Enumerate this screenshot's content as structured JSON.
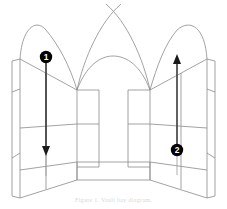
{
  "figure": {
    "background_color": "#ffffff",
    "width": 227,
    "height": 209,
    "line_color": "#8a8a8a",
    "heavy_line_color": "#555555",
    "marker_fill": "#000000",
    "marker_text_color": "#ffffff"
  },
  "caption": {
    "text": "Figure 1. Vault bay diagram."
  },
  "markers": [
    {
      "id": "marker-1",
      "label": "1",
      "center_x": 46,
      "center_y": 57,
      "radius": 6,
      "arrow_direction": "down",
      "arrow_from_y": 63,
      "arrow_to_y": 152,
      "arrow_x": 46,
      "tail_to_y": 176
    },
    {
      "id": "marker-2",
      "label": "2",
      "center_x": 177,
      "center_y": 150,
      "radius": 6,
      "arrow_direction": "up",
      "arrow_from_y": 144,
      "arrow_to_y": 58,
      "arrow_x": 177,
      "tail_to_y": 175
    }
  ],
  "geometry": {
    "left_strip": {
      "name": "left-outer-pier-strip",
      "top_outer_y": 59,
      "bottom_outer_y": 196
    },
    "right_strip": {
      "name": "right-outer-pier-strip",
      "top_outer_y": 59,
      "bottom_outer_y": 196
    },
    "springing_left": {
      "x": 77,
      "y": 90
    },
    "springing_right": {
      "x": 150,
      "y": 90
    },
    "arch_apex_center": {
      "x": 113,
      "y": 7
    },
    "arch_apex_left": {
      "x": 46,
      "y": 30
    },
    "arch_apex_right": {
      "x": 177,
      "y": 30
    },
    "low_arch_apex": {
      "x": 113,
      "y": 56
    },
    "floor_front_y": 180,
    "floor_back_y": 160,
    "band_y": 125
  }
}
